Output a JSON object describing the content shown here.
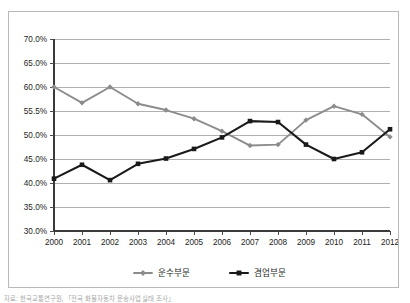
{
  "figure": {
    "background_color": "#ffffff",
    "frame_color": "#b9b9b9",
    "footnote": "자료: 한국교통연구원, 「전국 화물자동차 운송사업 실태 조사」"
  },
  "chart_data": {
    "type": "line",
    "title": "",
    "subtitle": "",
    "xlabel": "",
    "ylabel": "",
    "categories": [
      "2000",
      "2001",
      "2002",
      "2003",
      "2004",
      "2005",
      "2006",
      "2007",
      "2008",
      "2009",
      "2010",
      "2011",
      "2012"
    ],
    "ylim": [
      30.0,
      70.0
    ],
    "ytick_values": [
      70.0,
      65.0,
      60.0,
      55.0,
      50.0,
      45.0,
      40.0,
      35.0,
      30.0
    ],
    "ytick_labels": [
      "70.0%",
      "65.0%",
      "60.0%",
      "55.5%",
      "50.0%",
      "45.0%",
      "40.0%",
      "35.0%",
      "30.0%"
    ],
    "grid": true,
    "grid_axis": "y",
    "legend_position": "bottom",
    "series": [
      {
        "name": "운수부문",
        "color": "#8c8c8c",
        "marker": "diamond",
        "values": [
          60.0,
          56.7,
          60.0,
          56.5,
          55.2,
          53.4,
          50.8,
          47.8,
          48.0,
          53.1,
          56.0,
          54.3,
          49.6
        ]
      },
      {
        "name": "겸업부문",
        "color": "#1a1a1a",
        "marker": "square",
        "values": [
          40.9,
          43.8,
          40.6,
          44.0,
          45.1,
          47.1,
          49.5,
          52.9,
          52.7,
          48.0,
          45.0,
          46.4,
          51.2
        ]
      }
    ]
  }
}
